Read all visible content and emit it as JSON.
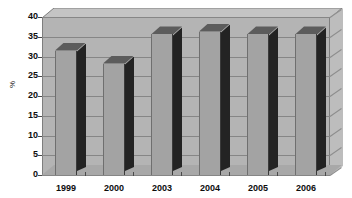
{
  "chart_data": {
    "type": "bar",
    "title": "",
    "subtitle": "",
    "xlabel": "",
    "ylabel": "%",
    "categories": [
      "1999",
      "2000",
      "2003",
      "2004",
      "2005",
      "2006"
    ],
    "values": [
      31.5,
      28.2,
      35.6,
      36.3,
      35.6,
      35.6
    ],
    "series": [
      {
        "name": "",
        "values": [
          31.5,
          28.2,
          35.6,
          36.3,
          35.6,
          35.6
        ]
      }
    ],
    "ylim": [
      0,
      40
    ],
    "ytick_values": [
      40,
      35,
      30,
      25,
      20,
      15,
      10,
      5,
      0
    ],
    "ytick_labels": [
      "40",
      "35",
      "30",
      "25",
      "20",
      "15",
      "10",
      "5",
      "0"
    ],
    "grid": true,
    "grid_axis": "y",
    "legend": false,
    "legend_position": "none",
    "style": "3d-column",
    "annotations": []
  },
  "colors": {
    "plot_background": "#b4b4b4",
    "ceiling": "#c4c4c4",
    "sidewall": "#bdbdbd",
    "floor": "#a8a8a8",
    "gridline": "#868686",
    "bar_front": "#a3a3a3",
    "bar_side": "#232323",
    "bar_top": "#5c5c5c",
    "axis_text": "#0d0d0d",
    "page_background": "#ffffff"
  }
}
